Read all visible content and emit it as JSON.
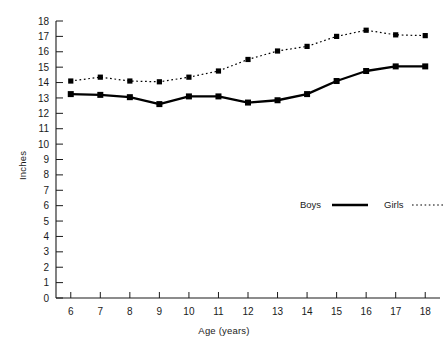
{
  "chart_data": {
    "type": "line",
    "title": "",
    "xlabel": "Age (years)",
    "ylabel": "Inches",
    "x": [
      6,
      7,
      8,
      9,
      10,
      11,
      12,
      13,
      14,
      15,
      16,
      17,
      18
    ],
    "categories": [
      "6",
      "7",
      "8",
      "9",
      "10",
      "11",
      "12",
      "13",
      "14",
      "15",
      "16",
      "17",
      "18"
    ],
    "xlim": [
      5.5,
      18.5
    ],
    "ylim": [
      0,
      18
    ],
    "ytick_labels": [
      "0",
      "1",
      "2",
      "3",
      "4",
      "5",
      "6",
      "7",
      "8",
      "9",
      "10",
      "11",
      "12",
      "13",
      "14",
      "15",
      "16",
      "17",
      "18"
    ],
    "yticks": [
      0,
      1,
      2,
      3,
      4,
      5,
      6,
      7,
      8,
      9,
      10,
      11,
      12,
      13,
      14,
      15,
      16,
      17,
      18
    ],
    "grid": false,
    "legend_position": "inside-lower-right",
    "marker": "square",
    "series": [
      {
        "name": "Boys",
        "line_style": "solid",
        "color": "#000000",
        "values": [
          13.25,
          13.2,
          13.05,
          12.6,
          13.1,
          13.1,
          12.7,
          12.85,
          13.25,
          14.1,
          14.75,
          15.05,
          15.05
        ]
      },
      {
        "name": "Girls",
        "line_style": "dotted",
        "color": "#000000",
        "values": [
          14.1,
          14.35,
          14.1,
          14.05,
          14.35,
          14.75,
          15.5,
          16.05,
          16.35,
          17.0,
          17.4,
          17.1,
          17.05
        ]
      }
    ]
  },
  "legend": {
    "boys_label": "Boys",
    "girls_label": "Girls"
  }
}
